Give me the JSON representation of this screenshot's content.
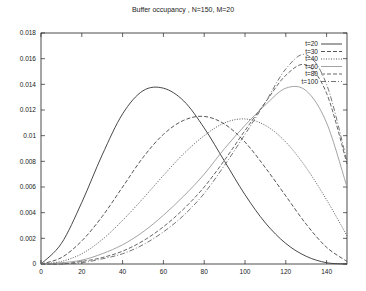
{
  "chart_data": {
    "type": "line",
    "title": "Buffer occupancy , N=150, M=20",
    "xlabel": "",
    "ylabel": "",
    "xlim": [
      0,
      150
    ],
    "ylim": [
      0,
      0.018
    ],
    "grid": false,
    "legend_position": "top-right",
    "x_ticks": [
      "0",
      "20",
      "40",
      "60",
      "80",
      "100",
      "120",
      "140"
    ],
    "y_ticks": [
      "0",
      "0.002",
      "0.004",
      "0.006",
      "0.008",
      "0.01",
      "0.012",
      "0.014",
      "0.016",
      "0.018"
    ],
    "x": [
      0,
      10,
      20,
      30,
      40,
      50,
      60,
      70,
      80,
      90,
      100,
      110,
      120,
      130,
      140,
      150
    ],
    "series": [
      {
        "name": "t=20",
        "style": "solid",
        "color": "#333333",
        "values": [
          0,
          0.0016,
          0.0048,
          0.0085,
          0.0117,
          0.0135,
          0.0137,
          0.0127,
          0.0106,
          0.008,
          0.0054,
          0.0032,
          0.0016,
          0.0006,
          0.0001,
          0
        ]
      },
      {
        "name": "t=30",
        "style": "dashed",
        "color": "#444444",
        "values": [
          0,
          0.0005,
          0.0018,
          0.0037,
          0.006,
          0.0083,
          0.0101,
          0.0112,
          0.0115,
          0.0109,
          0.0095,
          0.0075,
          0.0053,
          0.0031,
          0.0013,
          0.0002
        ]
      },
      {
        "name": "t=40",
        "style": "dotted",
        "color": "#444444",
        "values": [
          0,
          0.0002,
          0.0008,
          0.0019,
          0.0034,
          0.0051,
          0.0069,
          0.0086,
          0.01,
          0.011,
          0.0113,
          0.0108,
          0.0095,
          0.0075,
          0.005,
          0.0022
        ]
      },
      {
        "name": "t=60",
        "style": "solid",
        "color": "#999999",
        "values": [
          0,
          0.0001,
          0.0003,
          0.0008,
          0.0015,
          0.0025,
          0.0038,
          0.0053,
          0.007,
          0.009,
          0.0108,
          0.0124,
          0.0137,
          0.0135,
          0.011,
          0.006
        ]
      },
      {
        "name": "t=80",
        "style": "dashed",
        "color": "#555555",
        "values": [
          0,
          0,
          0.0002,
          0.0005,
          0.001,
          0.0018,
          0.0029,
          0.0043,
          0.006,
          0.0081,
          0.0104,
          0.0126,
          0.0147,
          0.0155,
          0.0133,
          0.0078
        ]
      },
      {
        "name": "t=100",
        "style": "dashdot",
        "color": "#666666",
        "values": [
          0,
          0,
          0.0001,
          0.0004,
          0.0008,
          0.0015,
          0.0025,
          0.0038,
          0.0055,
          0.0077,
          0.0101,
          0.0126,
          0.0152,
          0.0163,
          0.014,
          0.008
        ]
      }
    ]
  }
}
